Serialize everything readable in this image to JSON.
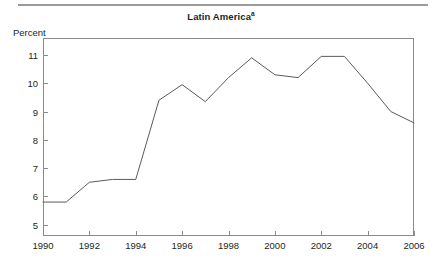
{
  "figure": {
    "title": "Latin America",
    "title_footnote_marker": "a",
    "axis_unit_label": "Percent",
    "line_color": "#5a5a5a",
    "frame_color": "#8a8a8a",
    "rule_color": "#9b9b9b",
    "text_color": "#231f20"
  },
  "chart_data": {
    "type": "line",
    "title": "Latin America",
    "xlabel": "",
    "ylabel": "Percent",
    "xlim": [
      1990,
      2006
    ],
    "ylim": [
      4.6,
      11.6
    ],
    "grid": false,
    "legend": null,
    "y_ticks": [
      5,
      6,
      7,
      8,
      9,
      10,
      11
    ],
    "y_tick_labels": [
      "5",
      "6",
      "7",
      "8",
      "9",
      "10",
      "11"
    ],
    "x_ticks": [
      1990,
      1992,
      1994,
      1996,
      1998,
      2000,
      2002,
      2004,
      2006
    ],
    "x_tick_labels": [
      "1990",
      "1992",
      "1994",
      "1996",
      "1998",
      "2000",
      "2002",
      "2004",
      "2006"
    ],
    "x": [
      1990,
      1991,
      1992,
      1993,
      1994,
      1995,
      1996,
      1997,
      1998,
      1999,
      2000,
      2001,
      2002,
      2003,
      2004,
      2005,
      2006
    ],
    "values": [
      5.8,
      5.8,
      6.5,
      6.6,
      6.6,
      9.4,
      9.95,
      9.35,
      10.2,
      10.9,
      10.3,
      10.2,
      10.95,
      10.95,
      10.0,
      9.0,
      8.6
    ],
    "series": [
      {
        "name": "Latin America",
        "values": [
          5.8,
          5.8,
          6.5,
          6.6,
          6.6,
          9.4,
          9.95,
          9.35,
          10.2,
          10.9,
          10.3,
          10.2,
          10.95,
          10.95,
          10.0,
          9.0,
          8.6
        ]
      }
    ]
  }
}
